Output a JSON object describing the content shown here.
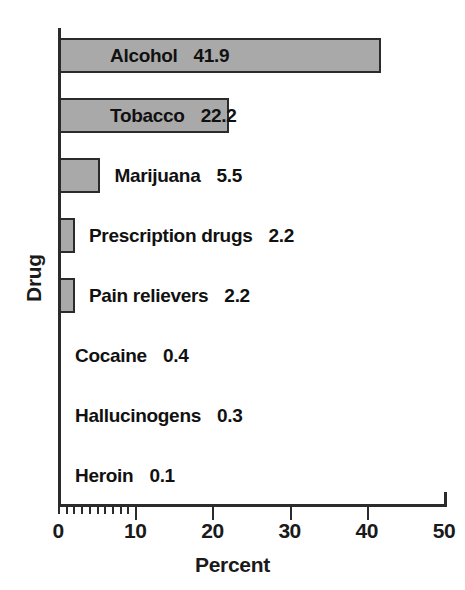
{
  "chart_data": {
    "type": "bar",
    "orientation": "horizontal",
    "title": "",
    "xlabel": "Percent",
    "ylabel": "Drug",
    "xlim": [
      0,
      50
    ],
    "xticks": [
      0,
      10,
      20,
      30,
      40,
      50
    ],
    "xtick_labels": [
      "0",
      "10",
      "20",
      "30",
      "40",
      "50"
    ],
    "minor_tick_step": 1,
    "minor_tick_range": [
      0,
      10
    ],
    "grid": false,
    "legend": null,
    "categories": [
      "Alcohol",
      "Tobacco",
      "Marijuana",
      "Prescription drugs",
      "Pain relievers",
      "Cocaine",
      "Hallucinogens",
      "Heroin"
    ],
    "values": [
      41.9,
      22.2,
      5.5,
      2.2,
      2.2,
      0.4,
      0.3,
      0.1
    ],
    "value_labels": [
      "41.9",
      "22.2",
      "5.5",
      "2.2",
      "2.2",
      "0.4",
      "0.3",
      "0.1"
    ],
    "bar_fill_color": "#a9a9a9",
    "bar_edge_color": "#2b2b2b",
    "axis_color": "#2b2b2b",
    "background_color": "#ffffff",
    "bars": [
      {
        "category": "Alcohol",
        "value": 41.9,
        "value_label": "41.9",
        "label_placement": "inside"
      },
      {
        "category": "Tobacco",
        "value": 22.2,
        "value_label": "22.2",
        "label_placement": "inside"
      },
      {
        "category": "Marijuana",
        "value": 5.5,
        "value_label": "5.5",
        "label_placement": "outside"
      },
      {
        "category": "Prescription drugs",
        "value": 2.2,
        "value_label": "2.2",
        "label_placement": "outside"
      },
      {
        "category": "Pain relievers",
        "value": 2.2,
        "value_label": "2.2",
        "label_placement": "outside"
      },
      {
        "category": "Cocaine",
        "value": 0.4,
        "value_label": "0.4",
        "label_placement": "outside"
      },
      {
        "category": "Hallucinogens",
        "value": 0.3,
        "value_label": "0.3",
        "label_placement": "outside"
      },
      {
        "category": "Heroin",
        "value": 0.1,
        "value_label": "0.1",
        "label_placement": "outside"
      }
    ]
  }
}
